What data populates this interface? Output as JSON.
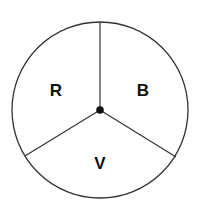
{
  "diagram": {
    "type": "spinner",
    "sections": [
      {
        "label": "R",
        "x": 56,
        "y": 96
      },
      {
        "label": "B",
        "x": 143,
        "y": 96
      },
      {
        "label": "V",
        "x": 100,
        "y": 169
      }
    ],
    "colors": {
      "stroke": "#333333",
      "background": "#ffffff",
      "text": "#111111"
    }
  }
}
